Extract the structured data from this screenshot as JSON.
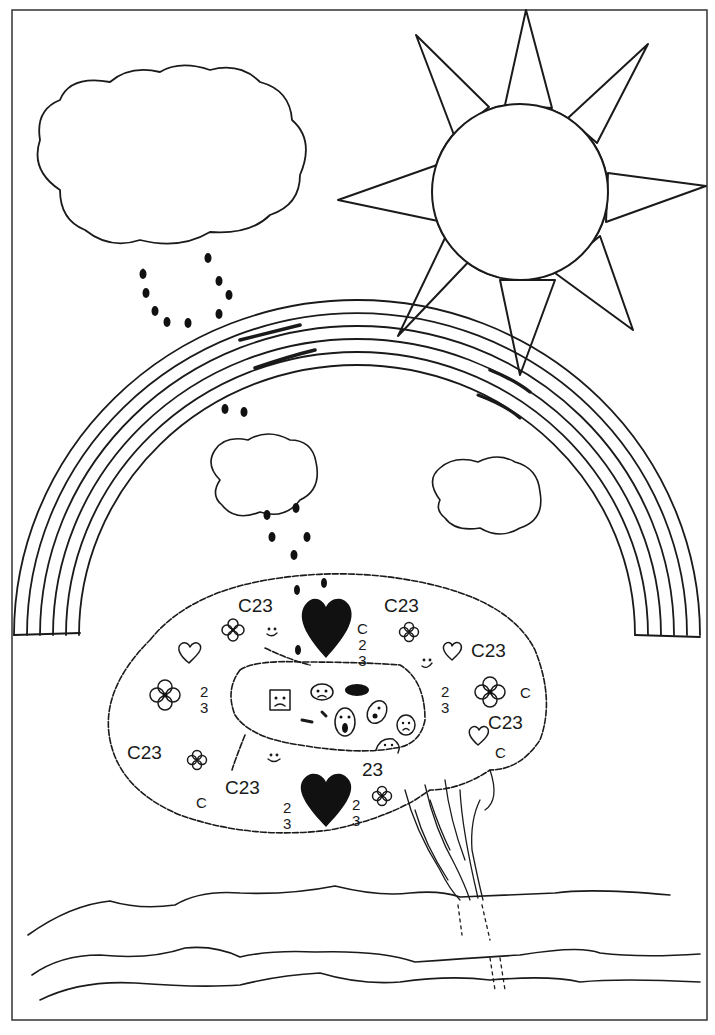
{
  "drawing": {
    "title": "Hand-drawn brain under rainbow, sun, and rain clouds",
    "frame": {
      "x": 12,
      "y": 10,
      "width": 695,
      "height": 1010,
      "stroke": "#333333"
    },
    "ink_color": "#1a1a1a",
    "background": "#ffffff"
  },
  "labels": [
    {
      "id": "c23-top-left",
      "text": "C23",
      "x": 238,
      "y": 596
    },
    {
      "id": "c23-top-right",
      "text": "C23",
      "x": 384,
      "y": 596
    },
    {
      "id": "c23-right-upper",
      "text": "C23",
      "x": 471,
      "y": 641
    },
    {
      "id": "c23-right-lower",
      "text": "C23",
      "x": 488,
      "y": 713
    },
    {
      "id": "c23-left-lower",
      "text": "C23",
      "x": 127,
      "y": 743
    },
    {
      "id": "c23-bottom-left",
      "text": "C23",
      "x": 225,
      "y": 778
    },
    {
      "id": "num-23-center",
      "text": "23",
      "x": 362,
      "y": 760
    },
    {
      "id": "c-right-edge",
      "text": "C",
      "x": 520,
      "y": 685
    },
    {
      "id": "c-right-bottom",
      "text": "C",
      "x": 495,
      "y": 745
    },
    {
      "id": "c-bottom-left",
      "text": "C",
      "x": 196,
      "y": 795
    }
  ],
  "stacked_labels": [
    {
      "id": "c23-stack-center",
      "text": "C\n2\n3",
      "x": 357,
      "y": 621
    },
    {
      "id": "23-stack-left",
      "text": "2\n3",
      "x": 200,
      "y": 684
    },
    {
      "id": "23-stack-right",
      "text": "2\n3",
      "x": 441,
      "y": 684
    },
    {
      "id": "23-stack-bottom-left",
      "text": "2\n3",
      "x": 283,
      "y": 800
    },
    {
      "id": "23-stack-bottom-right",
      "text": "2\n3",
      "x": 352,
      "y": 797
    }
  ],
  "elements": {
    "sun": {
      "cx": 520,
      "cy": 192,
      "r": 88,
      "rays": 8
    },
    "big_cloud": {
      "x": 35,
      "y": 65,
      "width": 275,
      "height": 175
    },
    "small_cloud_left": {
      "x": 208,
      "y": 437,
      "width": 110,
      "height": 80
    },
    "small_cloud_right": {
      "x": 428,
      "y": 458,
      "width": 115,
      "height": 75
    },
    "rainbow": {
      "cx": 357,
      "cy": 640,
      "outer_r": 345,
      "bands": 6,
      "band_gap": 11
    },
    "brain": {
      "x": 105,
      "y": 570,
      "width": 440,
      "height": 270
    },
    "waves": 3
  }
}
